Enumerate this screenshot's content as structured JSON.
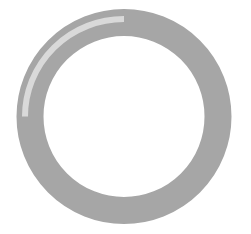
{
  "loader": {
    "type": "circular-progress-ring",
    "colors": {
      "track": "#a6a6a6",
      "highlight": "#d9d9d9",
      "background": "#ffffff"
    }
  }
}
